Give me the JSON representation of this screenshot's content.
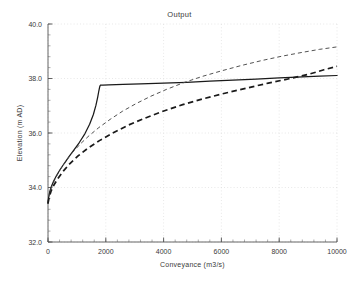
{
  "chart_data": {
    "type": "line",
    "title": "Output",
    "xlabel": "Conveyance (m3/s)",
    "ylabel": "Elevation (m AD)",
    "xlim": [
      0,
      10000
    ],
    "ylim": [
      32.0,
      40.0
    ],
    "xticks": [
      0,
      2000,
      4000,
      6000,
      8000,
      10000
    ],
    "yticks": [
      32.0,
      34.0,
      36.0,
      38.0,
      40.0
    ],
    "xticklabels": [
      "0",
      "2000",
      "4000",
      "6000",
      "8000",
      "10000"
    ],
    "yticklabels": [
      "32.0",
      "34.0",
      "36.0",
      "38.0",
      "40.0"
    ],
    "x_minor_interval": 400,
    "y_minor_interval": 0.4,
    "grid": true,
    "grid_style": "dotted",
    "legend": null,
    "series": [
      {
        "name": "solid-curve",
        "style": "solid",
        "color": "#1a1a1a",
        "points": [
          [
            0,
            33.42
          ],
          [
            20,
            33.62
          ],
          [
            60,
            33.85
          ],
          [
            120,
            34.05
          ],
          [
            200,
            34.25
          ],
          [
            300,
            34.45
          ],
          [
            420,
            34.66
          ],
          [
            560,
            34.88
          ],
          [
            720,
            35.12
          ],
          [
            900,
            35.38
          ],
          [
            1090,
            35.66
          ],
          [
            1280,
            35.98
          ],
          [
            1440,
            36.32
          ],
          [
            1570,
            36.68
          ],
          [
            1660,
            37.02
          ],
          [
            1720,
            37.32
          ],
          [
            1760,
            37.55
          ],
          [
            1790,
            37.7
          ],
          [
            1810,
            37.755
          ],
          [
            1900,
            37.76
          ],
          [
            2100,
            37.765
          ],
          [
            2600,
            37.78
          ],
          [
            3200,
            37.8
          ],
          [
            4000,
            37.83
          ],
          [
            4800,
            37.86
          ],
          [
            5600,
            37.9
          ],
          [
            6400,
            37.94
          ],
          [
            7200,
            37.98
          ],
          [
            8000,
            38.02
          ],
          [
            8800,
            38.06
          ],
          [
            9400,
            38.09
          ],
          [
            10000,
            38.11
          ]
        ]
      },
      {
        "name": "thin-dashed-curve",
        "style": "dashed-thin",
        "color": "#4a4a4a",
        "points": [
          [
            0,
            33.42
          ],
          [
            30,
            33.66
          ],
          [
            90,
            33.92
          ],
          [
            180,
            34.16
          ],
          [
            300,
            34.42
          ],
          [
            450,
            34.7
          ],
          [
            640,
            35.0
          ],
          [
            860,
            35.3
          ],
          [
            1120,
            35.6
          ],
          [
            1420,
            35.9
          ],
          [
            1760,
            36.2
          ],
          [
            2150,
            36.5
          ],
          [
            2580,
            36.8
          ],
          [
            3050,
            37.08
          ],
          [
            3560,
            37.35
          ],
          [
            4100,
            37.6
          ],
          [
            4700,
            37.85
          ],
          [
            5350,
            38.08
          ],
          [
            6000,
            38.28
          ],
          [
            6700,
            38.48
          ],
          [
            7400,
            38.66
          ],
          [
            8100,
            38.82
          ],
          [
            8800,
            38.96
          ],
          [
            9400,
            39.07
          ],
          [
            10000,
            39.16
          ]
        ]
      },
      {
        "name": "thick-dashed-curve",
        "style": "dashed-thick",
        "color": "#1a1a1a",
        "points": [
          [
            0,
            33.42
          ],
          [
            40,
            33.64
          ],
          [
            110,
            33.88
          ],
          [
            210,
            34.1
          ],
          [
            350,
            34.34
          ],
          [
            530,
            34.6
          ],
          [
            760,
            34.88
          ],
          [
            1040,
            35.16
          ],
          [
            1380,
            35.44
          ],
          [
            1780,
            35.72
          ],
          [
            2240,
            36.0
          ],
          [
            2760,
            36.28
          ],
          [
            3340,
            36.54
          ],
          [
            3980,
            36.8
          ],
          [
            4660,
            37.04
          ],
          [
            5380,
            37.26
          ],
          [
            6120,
            37.46
          ],
          [
            6880,
            37.65
          ],
          [
            7620,
            37.83
          ],
          [
            8340,
            37.99
          ],
          [
            9000,
            38.15
          ],
          [
            9550,
            38.32
          ],
          [
            10000,
            38.45
          ]
        ]
      }
    ]
  }
}
